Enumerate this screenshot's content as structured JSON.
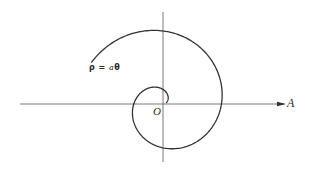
{
  "diagram": {
    "type": "archimedean-spiral",
    "formula": {
      "rho": "ρ",
      "equals": "=",
      "a": "a",
      "theta": "θ",
      "full_text": "ρ = aθ"
    },
    "labels": {
      "polar_axis": "A",
      "origin": "O"
    },
    "geometry": {
      "origin": [
        163,
        104
      ],
      "horizontal_axis": {
        "x1": 20,
        "x2": 284,
        "y": 104
      },
      "vertical_axis": {
        "x": 163,
        "y1": 12,
        "y2": 162
      },
      "spiral": {
        "a_px_per_rad": 9.3,
        "theta_start_deg": 20,
        "theta_end_deg": 510,
        "direction": "counterclockwise"
      }
    },
    "colors": {
      "stroke": "#333333",
      "axis": "#555555",
      "background": "#ffffff"
    }
  }
}
